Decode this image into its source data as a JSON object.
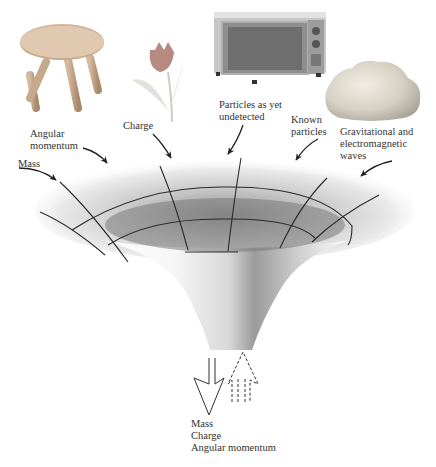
{
  "diagram": {
    "objects": [
      {
        "name": "stool",
        "kind": "image"
      },
      {
        "name": "tulip",
        "kind": "image"
      },
      {
        "name": "microwave",
        "kind": "image"
      },
      {
        "name": "rock",
        "kind": "image"
      }
    ],
    "input_labels": {
      "mass": "Mass",
      "angular_momentum": [
        "Angular",
        "momentum"
      ],
      "charge": "Charge",
      "undetected": [
        "Particles as yet",
        "undetected"
      ],
      "known": [
        "Known",
        "particles"
      ],
      "waves": [
        "Gravitational and",
        "electromagnetic",
        "waves"
      ]
    },
    "output_labels": [
      "Mass",
      "Charge",
      "Angular momentum"
    ],
    "colors": {
      "ink": "#222222",
      "funnel_light": "#f4f4f4",
      "funnel_dark": "#8a8a8a"
    }
  }
}
